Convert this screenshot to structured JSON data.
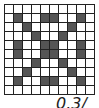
{
  "grid": {
    "rows": 10,
    "cols": 10,
    "fill_color": "#555555",
    "filled": [
      [
        0,
        0,
        0,
        0,
        0,
        0,
        0,
        0,
        0,
        0
      ],
      [
        0,
        1,
        0,
        0,
        1,
        1,
        0,
        0,
        1,
        0
      ],
      [
        0,
        0,
        1,
        0,
        0,
        0,
        0,
        1,
        0,
        0
      ],
      [
        0,
        0,
        0,
        1,
        0,
        0,
        1,
        0,
        0,
        0
      ],
      [
        0,
        1,
        0,
        0,
        1,
        1,
        0,
        0,
        1,
        0
      ],
      [
        0,
        1,
        0,
        0,
        1,
        1,
        0,
        0,
        1,
        0
      ],
      [
        0,
        0,
        0,
        1,
        0,
        0,
        1,
        0,
        0,
        0
      ],
      [
        0,
        0,
        1,
        0,
        0,
        0,
        0,
        1,
        0,
        0
      ],
      [
        0,
        1,
        0,
        0,
        1,
        1,
        0,
        0,
        1,
        0
      ],
      [
        0,
        0,
        0,
        0,
        0,
        0,
        0,
        0,
        0,
        0
      ]
    ]
  },
  "caption": {
    "text": "0.3/"
  }
}
